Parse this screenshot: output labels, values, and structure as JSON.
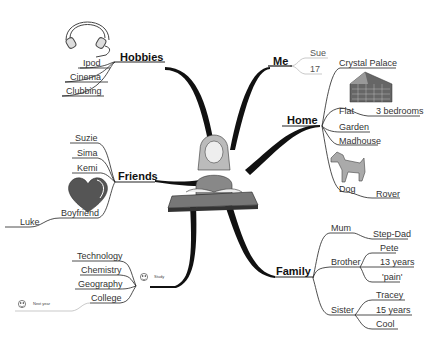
{
  "center": {
    "image": "woman-at-desk"
  },
  "branches": {
    "hobbies": {
      "label": "Hobbies",
      "items": [
        "Ipod",
        "Cinema",
        "Clubbing"
      ],
      "image": "headphones"
    },
    "me": {
      "label": "Me",
      "items": [
        "Sue",
        "17"
      ]
    },
    "home": {
      "label": "Home",
      "items": [
        "Crystal Palace",
        "Flat",
        "3 bedrooms",
        "Garden",
        "Madhouse",
        "Dog",
        "Rover"
      ],
      "images": [
        "building",
        "dog"
      ]
    },
    "friends": {
      "label": "Friends",
      "items": [
        "Suzie",
        "Sima",
        "Kemi",
        "Boyfriend",
        "Luke"
      ],
      "image": "heart"
    },
    "family": {
      "label": "Family",
      "items": [
        "Mum",
        "Step-Dad",
        "Brother",
        "Pete",
        "13 years",
        "'pain'",
        "Sister",
        "Tracey",
        "15 years",
        "Cool"
      ]
    },
    "study": {
      "label": "Study",
      "items": [
        "Technology",
        "Chemistry",
        "Geography",
        "College"
      ],
      "next": "Next year"
    }
  },
  "colors": {
    "line": "#111111",
    "thin": "#444444",
    "light": "#bbbbbb"
  }
}
